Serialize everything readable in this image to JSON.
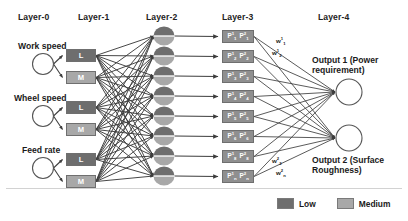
{
  "diagram": {
    "layer_labels": [
      {
        "id": "layer-0",
        "text": "Layer-0",
        "x": 18,
        "y": 12
      },
      {
        "id": "layer-1",
        "text": "Layer-1",
        "x": 78,
        "y": 12
      },
      {
        "id": "layer-2",
        "text": "Layer-2",
        "x": 146,
        "y": 12
      },
      {
        "id": "layer-3",
        "text": "Layer-3",
        "x": 222,
        "y": 12
      },
      {
        "id": "layer-4",
        "text": "Layer-4",
        "x": 318,
        "y": 12
      }
    ],
    "inputs": [
      {
        "id": "work-speed",
        "label": "Work speed",
        "label_x": 18,
        "label_y": 41,
        "cx": 43,
        "cy": 64,
        "r": 10.5
      },
      {
        "id": "wheel-speed",
        "label": "Wheel speed",
        "label_x": 14,
        "label_y": 93,
        "cx": 43,
        "cy": 116,
        "r": 10.5
      },
      {
        "id": "feed-rate",
        "label": "Feed rate",
        "label_x": 22,
        "label_y": 145,
        "cx": 43,
        "cy": 168,
        "r": 10.5
      }
    ],
    "membership_boxes": [
      {
        "id": "work-speed-low",
        "label": "L",
        "kind": "low",
        "x": 66,
        "y": 49
      },
      {
        "id": "work-speed-medium",
        "label": "M",
        "kind": "medium",
        "x": 66,
        "y": 71
      },
      {
        "id": "wheel-speed-low",
        "label": "L",
        "kind": "low",
        "x": 66,
        "y": 101
      },
      {
        "id": "wheel-speed-medium",
        "label": "M",
        "kind": "medium",
        "x": 66,
        "y": 123
      },
      {
        "id": "feed-rate-low",
        "label": "L",
        "kind": "low",
        "x": 66,
        "y": 153
      },
      {
        "id": "feed-rate-medium",
        "label": "M",
        "kind": "medium",
        "x": 66,
        "y": 175
      }
    ],
    "rule_nodes": [
      {
        "id": "rule-1",
        "cx": 164,
        "cy": 36,
        "rx": 10.5,
        "ry": 9.5
      },
      {
        "id": "rule-2",
        "cx": 164,
        "cy": 56,
        "rx": 10.5,
        "ry": 9.5
      },
      {
        "id": "rule-3",
        "cx": 164,
        "cy": 76,
        "rx": 10.5,
        "ry": 9.5
      },
      {
        "id": "rule-4",
        "cx": 164,
        "cy": 96,
        "rx": 10.5,
        "ry": 9.5
      },
      {
        "id": "rule-5",
        "cx": 164,
        "cy": 116,
        "rx": 10.5,
        "ry": 9.5
      },
      {
        "id": "rule-6",
        "cx": 164,
        "cy": 136,
        "rx": 10.5,
        "ry": 9.5
      },
      {
        "id": "rule-7",
        "cx": 164,
        "cy": 156,
        "rx": 10.5,
        "ry": 9.5
      },
      {
        "id": "rule-8",
        "cx": 164,
        "cy": 176,
        "rx": 10.5,
        "ry": 9.5
      }
    ],
    "consequent_nodes": [
      {
        "id": "p-node-1",
        "x": 222,
        "y": 30,
        "term1": "P",
        "sup1": "1",
        "sub1": "1",
        "term2": "P",
        "sup2": "2",
        "sub2": "1"
      },
      {
        "id": "p-node-2",
        "x": 222,
        "y": 50,
        "term1": "P",
        "sup1": "1",
        "sub1": "2",
        "term2": "P",
        "sup2": "2",
        "sub2": "2"
      },
      {
        "id": "p-node-3",
        "x": 222,
        "y": 70,
        "term1": "P",
        "sup1": "1",
        "sub1": "3",
        "term2": "P",
        "sup2": "2",
        "sub2": "3"
      },
      {
        "id": "p-node-4",
        "x": 222,
        "y": 90,
        "term1": "P",
        "sup1": "1",
        "sub1": "4",
        "term2": "P",
        "sup2": "2",
        "sub2": "4"
      },
      {
        "id": "p-node-5",
        "x": 222,
        "y": 110,
        "term1": "P",
        "sup1": "1",
        "sub1": "5",
        "term2": "P",
        "sup2": "2",
        "sub2": "5"
      },
      {
        "id": "p-node-6",
        "x": 222,
        "y": 130,
        "term1": "P",
        "sup1": "1",
        "sub1": "6",
        "term2": "P",
        "sup2": "2",
        "sub2": "6"
      },
      {
        "id": "p-node-7",
        "x": 222,
        "y": 150,
        "term1": "P",
        "sup1": "1",
        "sub1": "8",
        "term2": "P",
        "sup2": "2",
        "sub2": "8"
      },
      {
        "id": "p-node-8",
        "x": 222,
        "y": 170,
        "term1": "P",
        "sup1": "1",
        "sub1": "n",
        "term2": "P",
        "sup2": "2",
        "sub2": "n"
      }
    ],
    "weight_labels": [
      {
        "id": "weight-w1-1",
        "base": "w",
        "sup": "1",
        "sub": "1",
        "x": 276,
        "y": 36
      },
      {
        "id": "weight-w1-2",
        "base": "w",
        "sup": "1",
        "sub": "2",
        "x": 272,
        "y": 48
      },
      {
        "id": "weight-w2-2",
        "base": "w",
        "sup": "2",
        "sub": "2",
        "x": 272,
        "y": 156
      },
      {
        "id": "weight-w2-n",
        "base": "w",
        "sup": "2",
        "sub": "n",
        "x": 276,
        "y": 168
      }
    ],
    "outputs": [
      {
        "id": "output-1",
        "label": "Output 1 (Power requirement)",
        "label_x": 312,
        "label_y": 55,
        "cx": 349,
        "cy": 92,
        "r": 13
      },
      {
        "id": "output-2",
        "label": "Output 2 (Surface Roughness)",
        "label_x": 312,
        "label_y": 155,
        "cx": 349,
        "cy": 138,
        "r": 13
      }
    ],
    "legend": {
      "low_label": "Low",
      "medium_label": "Medium"
    },
    "colors": {
      "low": "#6e6e6e",
      "medium": "#a8a8a8",
      "rule_top": "#6e6e6e",
      "rule_bottom": "#a8a8a8",
      "consequent": "#8f8f8f",
      "edge": "#4a4a4a",
      "outline": "#555555"
    }
  }
}
